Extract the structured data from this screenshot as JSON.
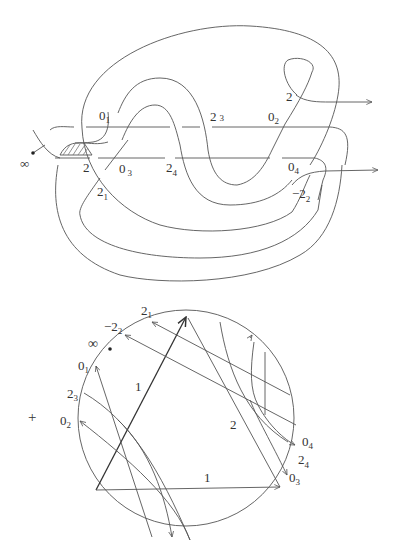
{
  "knot_diagram": {
    "basepoint_label": "∞",
    "crossings": [
      {
        "id": "0_1",
        "base": "0",
        "sub": "1"
      },
      {
        "id": "2_3",
        "base": "2",
        "sub": "3"
      },
      {
        "id": "0_2",
        "base": "0",
        "sub": "2"
      },
      {
        "id": "2_top",
        "base": "2",
        "sub": ""
      },
      {
        "id": "2_left",
        "base": "2",
        "sub": ""
      },
      {
        "id": "0_3",
        "base": "0",
        "sub": "3"
      },
      {
        "id": "2_4",
        "base": "2",
        "sub": "4"
      },
      {
        "id": "0_4",
        "base": "0",
        "sub": "4"
      },
      {
        "id": "2_1",
        "base": "2",
        "sub": "1"
      },
      {
        "id": "-2_2",
        "base": "−2",
        "sub": "2"
      }
    ]
  },
  "chord_diagram": {
    "sign_label": "+",
    "basepoint_label": "∞",
    "boundary_labels": [
      {
        "id": "2_1",
        "base": "2",
        "sub": "1"
      },
      {
        "id": "-2_2",
        "base": "−2",
        "sub": "2"
      },
      {
        "id": "0_1",
        "base": "0",
        "sub": "1"
      },
      {
        "id": "2_3",
        "base": "2",
        "sub": "3"
      },
      {
        "id": "0_2",
        "base": "0",
        "sub": "2"
      },
      {
        "id": "0_4",
        "base": "0",
        "sub": "4"
      },
      {
        "id": "2_4",
        "base": "2",
        "sub": "4"
      },
      {
        "id": "0_3",
        "base": "0",
        "sub": "3"
      }
    ],
    "triangle_labels": {
      "left_edge": "1",
      "bottom_edge": "1",
      "right_edge": "2"
    }
  }
}
